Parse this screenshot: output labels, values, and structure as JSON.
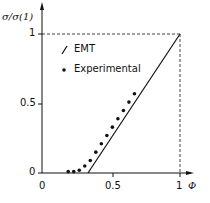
{
  "chart_data": {
    "type": "scatter",
    "title": "",
    "xlabel": "Φ",
    "ylabel": "σ/σ(1)",
    "xlim": [
      0,
      1
    ],
    "ylim": [
      0,
      1
    ],
    "grid": false,
    "legend_position": "upper-left-inside",
    "x_ticks": [
      "0",
      "0.5",
      "1"
    ],
    "y_ticks": [
      "0",
      "0.5",
      "1"
    ],
    "series": [
      {
        "name": "EMT",
        "kind": "line",
        "x": [
          0.333,
          1.0
        ],
        "y": [
          0.0,
          1.0
        ]
      },
      {
        "name": "Experimental",
        "kind": "scatter",
        "x": [
          0.19,
          0.23,
          0.27,
          0.31,
          0.35,
          0.39,
          0.43,
          0.47,
          0.51,
          0.55,
          0.59,
          0.63,
          0.67
        ],
        "y": [
          0.01,
          0.01,
          0.02,
          0.05,
          0.09,
          0.15,
          0.21,
          0.27,
          0.33,
          0.39,
          0.45,
          0.51,
          0.57
        ]
      }
    ],
    "annotations": [
      "dashed guide lines at y=1 and x=1"
    ]
  },
  "labels": {
    "ylabel": "σ/σ(1)",
    "xlabel": "Φ",
    "legend_emt": "EMT",
    "legend_exp": "Experimental",
    "ytick_1": "1",
    "ytick_05": "0.5",
    "ytick_0": "0",
    "xtick_0": "0",
    "xtick_05": "0.5",
    "xtick_1": "1"
  }
}
